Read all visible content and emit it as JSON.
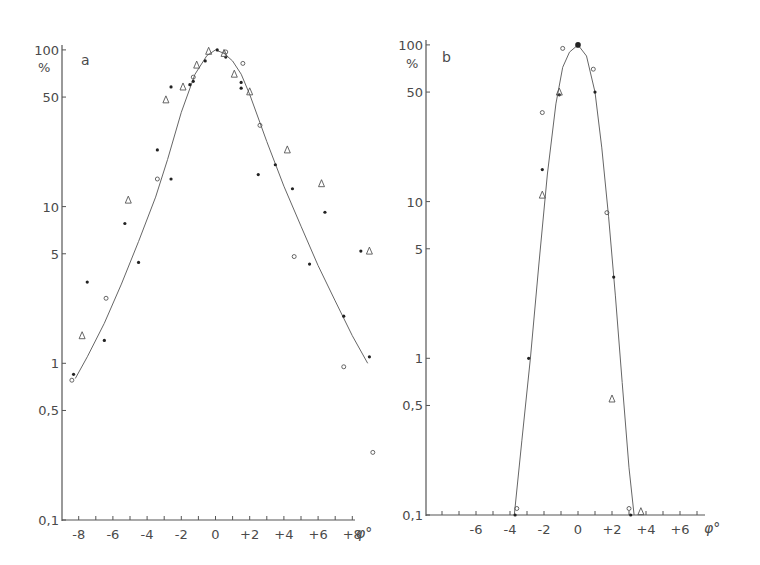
{
  "chart_data": [
    {
      "panel": "a",
      "type": "scatter",
      "title": "a",
      "ylabel": "%",
      "xlabel": "φ°",
      "yscale": "log",
      "ylim": [
        0.1,
        100
      ],
      "xlim": [
        -8.5,
        8.5
      ],
      "xticks": [
        "-8",
        "-6",
        "-4",
        "-2",
        "0",
        "+2",
        "+4",
        "+6",
        "+8"
      ],
      "xtick_values": [
        -8,
        -6,
        -4,
        -2,
        0,
        2,
        4,
        6,
        8
      ],
      "yticks": [
        "100",
        "50",
        "10",
        "5",
        "1",
        "0,5",
        "0,1"
      ],
      "ytick_values": [
        100,
        50,
        10,
        5,
        1,
        0.5,
        0.1
      ],
      "grid": false,
      "curve": {
        "x": [
          -8.2,
          -7.5,
          -6.5,
          -5.5,
          -4.5,
          -3.5,
          -2.8,
          -2,
          -1.2,
          -0.5,
          0,
          0.5,
          1,
          1.5,
          2,
          3,
          4,
          5,
          6,
          7,
          8,
          8.9
        ],
        "y": [
          0.8,
          1.1,
          1.8,
          3.2,
          6.0,
          11.5,
          20,
          40,
          70,
          92,
          100,
          95,
          85,
          70,
          52,
          26,
          13.5,
          7.5,
          4.2,
          2.5,
          1.5,
          1.0
        ]
      },
      "series": [
        {
          "name": "filled dots",
          "marker": "dot",
          "x": [
            -8.3,
            -7.5,
            -6.5,
            -5.3,
            -4.5,
            -3.4,
            -2.6,
            -2.6,
            -1.5,
            -1.3,
            -0.6,
            0.1,
            0.6,
            1.5,
            1.5,
            2.5,
            3.5,
            4.5,
            5.5,
            6.4,
            7.5,
            8.5,
            9.0
          ],
          "y": [
            0.85,
            3.3,
            1.4,
            7.8,
            4.4,
            23,
            15,
            58,
            60,
            63,
            85,
            100,
            90,
            62,
            57,
            16,
            18.5,
            13,
            4.3,
            9.2,
            2.0,
            5.2,
            1.1
          ]
        },
        {
          "name": "open circles",
          "marker": "circle",
          "x": [
            -8.4,
            -6.4,
            -3.4,
            -1.3,
            0.6,
            1.6,
            2.6,
            4.6,
            7.5,
            9.2
          ],
          "y": [
            0.78,
            2.6,
            15,
            67,
            97,
            82,
            33,
            4.8,
            0.95,
            0.27
          ]
        },
        {
          "name": "open triangles",
          "marker": "triangle",
          "x": [
            -7.8,
            -5.1,
            -2.9,
            -1.9,
            -1.1,
            -0.4,
            0.5,
            1.1,
            2.0,
            4.2,
            6.2,
            9.0
          ],
          "y": [
            1.5,
            11,
            48,
            58,
            80,
            98,
            95,
            70,
            54,
            23,
            14,
            5.2
          ]
        }
      ]
    },
    {
      "panel": "b",
      "type": "scatter",
      "title": "b",
      "ylabel": "%",
      "xlabel": "φ°",
      "yscale": "log",
      "ylim": [
        0.1,
        100
      ],
      "xlim": [
        -8.5,
        7.5
      ],
      "xticks": [
        "-6",
        "-4",
        "-2",
        "0",
        "+2",
        "+4",
        "+6"
      ],
      "xtick_values": [
        -6,
        -4,
        -2,
        0,
        2,
        4,
        6
      ],
      "yticks": [
        "100",
        "50",
        "10",
        "5",
        "1",
        "0,5",
        "0,1"
      ],
      "ytick_values": [
        100,
        50,
        10,
        5,
        1,
        0.5,
        0.1
      ],
      "grid": false,
      "curve": {
        "x": [
          -3.75,
          -3.3,
          -2.8,
          -2.3,
          -1.8,
          -1.3,
          -0.9,
          -0.5,
          0,
          0.5,
          1.0,
          1.4,
          1.8,
          2.2,
          2.6,
          3.0,
          3.3
        ],
        "y": [
          0.1,
          0.3,
          1.0,
          4.0,
          15,
          42,
          72,
          90,
          100,
          85,
          50,
          22,
          8,
          2.5,
          0.7,
          0.2,
          0.1
        ]
      },
      "series": [
        {
          "name": "filled dots",
          "marker": "dot",
          "x": [
            -3.7,
            -2.9,
            -2.1,
            -1.1,
            0,
            1.0,
            2.1,
            3.1
          ],
          "y": [
            0.1,
            1.0,
            16,
            48,
            100,
            50,
            3.3,
            0.1
          ]
        },
        {
          "name": "open circles",
          "marker": "circle",
          "x": [
            -3.6,
            -2.1,
            -0.9,
            0.9,
            1.7,
            3.0
          ],
          "y": [
            0.11,
            37,
            95,
            70,
            8.5,
            0.11
          ]
        },
        {
          "name": "open triangles",
          "marker": "triangle",
          "x": [
            -2.1,
            -1.1,
            2.0,
            3.7
          ],
          "y": [
            11,
            50,
            0.55,
            0.105
          ]
        }
      ]
    }
  ],
  "panels": {
    "a": {
      "label": "a",
      "y_unit": "%",
      "x_unit": "φ°"
    },
    "b": {
      "label": "b",
      "y_unit": "%",
      "x_unit": "φ°"
    }
  }
}
